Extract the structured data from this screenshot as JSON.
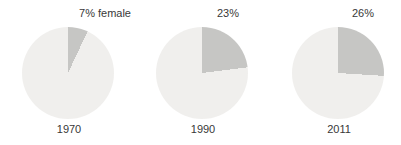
{
  "chart_data": {
    "type": "pie",
    "title": "",
    "description_series": "Percentage female by year",
    "legend_position": "none",
    "start_angle_deg": 0,
    "direction": "clockwise",
    "pies": [
      {
        "year": "1970",
        "value_pct": 7,
        "label": "7% female"
      },
      {
        "year": "1990",
        "value_pct": 23,
        "label": "23%"
      },
      {
        "year": "2011",
        "value_pct": 26,
        "label": "26%"
      }
    ],
    "colors": {
      "female_slice": "#c6c6c4",
      "remainder_slice": "#f0efed",
      "label_text": "#383838",
      "background": "#ffffff"
    }
  }
}
